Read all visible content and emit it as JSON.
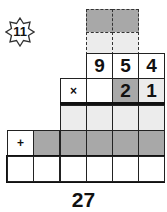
{
  "puzzle": {
    "badge_number": "11",
    "carry_rows": {
      "top": [
        "",
        ""
      ],
      "second": [
        "",
        ""
      ]
    },
    "multiplicand": [
      "9",
      "5",
      "4"
    ],
    "multiplier_row": {
      "operator": "×",
      "digits": [
        "",
        "2",
        "1"
      ]
    },
    "partial_product_1": [
      "",
      "",
      "",
      ""
    ],
    "partial_product_2": {
      "operator": "+",
      "digits": [
        "",
        "",
        "",
        "",
        ""
      ]
    },
    "answer_row": [
      "",
      "",
      "",
      "",
      "",
      ""
    ],
    "result_label": "27"
  },
  "colors": {
    "dark_cell": "#a8a8a8",
    "light_cell": "#ececec",
    "border": "#222222"
  }
}
